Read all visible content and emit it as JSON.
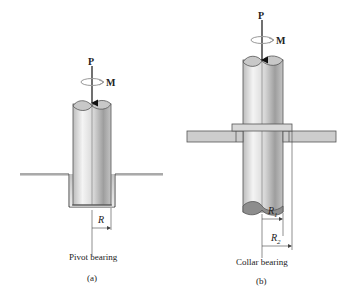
{
  "figure_a": {
    "force_label": "P",
    "moment_label": "M",
    "radius_label": "R",
    "caption": "Pivot bearing",
    "tag": "(a)"
  },
  "figure_b": {
    "force_label": "P",
    "moment_label": "M",
    "inner_radius_label": "R",
    "inner_radius_sub": "1",
    "outer_radius_label": "R",
    "outer_radius_sub": "2",
    "caption": "Collar bearing",
    "tag": "(b)"
  },
  "colors": {
    "shaft_light": "#e8e8e8",
    "shaft_dark": "#a8a8a8",
    "plate": "#cfcfcf",
    "line": "#333333"
  }
}
